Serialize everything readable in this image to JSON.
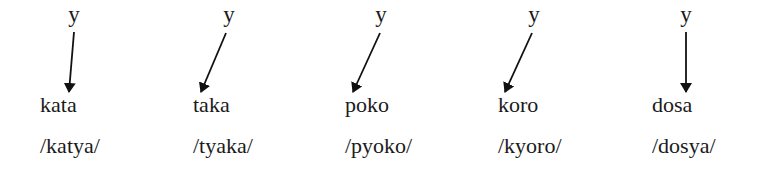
{
  "diagram": {
    "groups": [
      {
        "glide": "y",
        "word": "kata",
        "phonemic": "/katya/",
        "glide_x": 74,
        "word_x": 40,
        "arrow": {
          "x1": 74,
          "y1": 32,
          "x2": 69,
          "y2": 92
        }
      },
      {
        "glide": "y",
        "word": "taka",
        "phonemic": "/tyaka/",
        "glide_x": 229,
        "word_x": 193,
        "arrow": {
          "x1": 226,
          "y1": 33,
          "x2": 201,
          "y2": 92
        }
      },
      {
        "glide": "y",
        "word": "poko",
        "phonemic": "/pyoko/",
        "glide_x": 381,
        "word_x": 345,
        "arrow": {
          "x1": 380,
          "y1": 33,
          "x2": 353,
          "y2": 92
        }
      },
      {
        "glide": "y",
        "word": "koro",
        "phonemic": "/kyoro/",
        "glide_x": 534,
        "word_x": 498,
        "arrow": {
          "x1": 532,
          "y1": 33,
          "x2": 505,
          "y2": 92
        }
      },
      {
        "glide": "y",
        "word": "dosa",
        "phonemic": "/dosya/",
        "glide_x": 686,
        "word_x": 652,
        "arrow": {
          "x1": 686,
          "y1": 32,
          "x2": 686,
          "y2": 92
        }
      }
    ],
    "colors": {
      "text": "#1a1a1a",
      "arrow": "#111111",
      "background": "#ffffff"
    }
  }
}
